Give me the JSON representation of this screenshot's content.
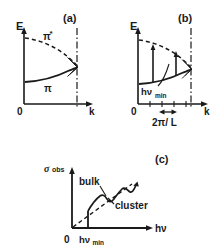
{
  "figure": {
    "caption_style": "hand-drawn scanned line art",
    "background_color": "#ffffff",
    "ink_color": "#1a1a1a"
  },
  "panels": [
    {
      "id": "a",
      "label": "(a)",
      "y_axis_label": "E",
      "x_axis_label": "k",
      "origin_label": "0",
      "curves": [
        {
          "name": "pi-star-band",
          "label": "π",
          "superscript": "*",
          "style": "dashed"
        },
        {
          "name": "pi-band",
          "label": "π",
          "superscript": "",
          "style": "solid"
        }
      ],
      "zone_boundary": {
        "name": "brillouin-zone-edge",
        "style": "dash-dot"
      },
      "hatching": {
        "name": "band-gap-hatching",
        "count": 5
      }
    },
    {
      "id": "b",
      "label": "(b)",
      "y_axis_label": "E",
      "x_axis_label": "k",
      "origin_label": "0",
      "transition_label": "hν",
      "transition_subscript": "min",
      "spacing_label": "2π/ L",
      "curves": [
        {
          "name": "pi-star-band",
          "style": "dashed"
        },
        {
          "name": "pi-band",
          "style": "solid"
        }
      ],
      "zone_boundary": {
        "name": "brillouin-zone-edge",
        "style": "dash-dot"
      },
      "k_tick_count": 5,
      "transition_arrow_count": 2
    },
    {
      "id": "c",
      "label": "(c)",
      "y_axis_label": "σ",
      "y_axis_subscript": "obs",
      "x_axis_label": "hν",
      "origin_label": "0",
      "threshold_label": "hν",
      "threshold_subscript": "min",
      "curves": [
        {
          "name": "bulk-absorption",
          "label": "bulk",
          "style": "dashed"
        },
        {
          "name": "cluster-absorption",
          "label": "cluster",
          "style": "solid-wiggly"
        }
      ]
    }
  ]
}
